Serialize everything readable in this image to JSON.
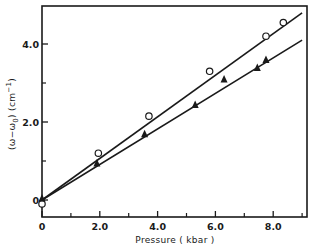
{
  "chart_data": {
    "type": "scatter",
    "title": "",
    "xlabel": "Pressure (kbar)",
    "ylabel": "(ω−ω0) (cm−1)",
    "xlim": [
      0,
      9.2
    ],
    "ylim": [
      -0.2,
      5.0
    ],
    "grid": false,
    "legend": null,
    "x_ticks_major": [
      0,
      2.0,
      4.0,
      6.0,
      8.0
    ],
    "x_tick_labels": [
      "0",
      "2.0",
      "4.0",
      "6.0",
      "8.0"
    ],
    "x_ticks_minor": [
      1,
      3,
      5,
      7,
      9
    ],
    "y_ticks_major": [
      0,
      2.0,
      4.0
    ],
    "y_tick_labels": [
      "0",
      "2.0",
      "4.0"
    ],
    "y_ticks_minor": [
      1,
      3
    ],
    "series": [
      {
        "name": "open circles",
        "marker": "circle-open",
        "x": [
          0,
          1.95,
          3.7,
          5.8,
          7.75,
          8.35
        ],
        "y": [
          -0.1,
          1.2,
          2.15,
          3.3,
          4.2,
          4.55
        ],
        "fit_line": {
          "x": [
            0,
            9.0
          ],
          "y": [
            0,
            4.8
          ]
        }
      },
      {
        "name": "filled triangles",
        "marker": "triangle-filled",
        "x": [
          0,
          1.9,
          3.55,
          5.3,
          6.3,
          7.45,
          7.75
        ],
        "y": [
          0.05,
          0.95,
          1.7,
          2.45,
          3.1,
          3.4,
          3.6
        ],
        "fit_line": {
          "x": [
            0,
            9.0
          ],
          "y": [
            0,
            4.1
          ]
        }
      }
    ]
  },
  "labels": {
    "xlabel": "Pressure  ( kbar )",
    "ylabel_main": "(ω−ω",
    "ylabel_sub": "0",
    "ylabel_tail": ")  (cm",
    "ylabel_sup": "−1",
    "ylabel_end": ")"
  },
  "colors": {
    "ink": "#1a1a1a",
    "background": "#ffffff"
  }
}
